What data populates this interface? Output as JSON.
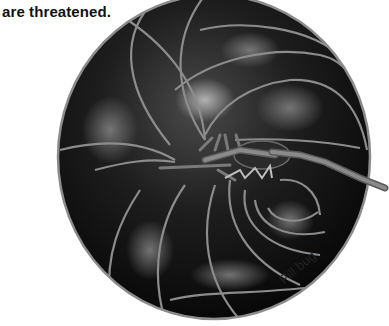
{
  "figure": {
    "caption_line_partial": "are threatened.",
    "label": "Pill bug",
    "colors": {
      "body_dark": "#0d0d0d",
      "body_mid": "#3a3a3a",
      "highlight": "#9a9a9a",
      "plate_edge": "#8c8c8c",
      "background": "#ffffff"
    }
  }
}
